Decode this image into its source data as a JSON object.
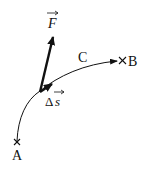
{
  "diagram": {
    "force_label": "F",
    "displacement_label_delta": "Δ",
    "displacement_label_s": "s",
    "path_label": "C",
    "start_point_label": "A",
    "end_point_label": "B",
    "colors": {
      "line": "#111111",
      "background": "#ffffff"
    }
  }
}
